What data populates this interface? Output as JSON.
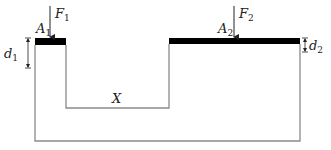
{
  "diagram": {
    "type": "hydraulic-press-schematic",
    "left_piston": {
      "area_label": "A",
      "area_sub": "1",
      "force_label": "F",
      "force_sub": "1",
      "displacement_label": "d",
      "displacement_sub": "1"
    },
    "right_piston": {
      "area_label": "A",
      "area_sub": "2",
      "force_label": "F",
      "force_sub": "2",
      "displacement_label": "d",
      "displacement_sub": "2"
    },
    "region_label": "X",
    "colors": {
      "piston": "#000000",
      "wall": "#8a8a8a",
      "text": "#222222"
    }
  }
}
